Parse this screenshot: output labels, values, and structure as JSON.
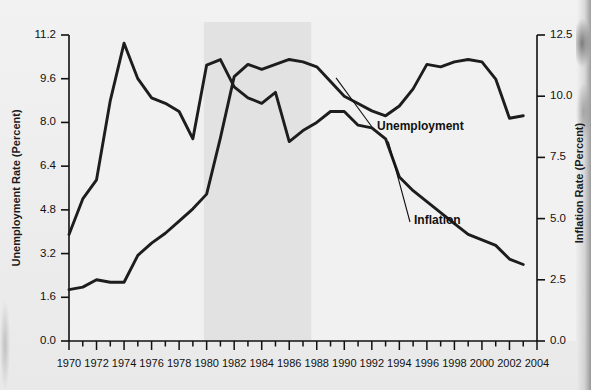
{
  "figure": {
    "background_color": "#efefef",
    "plot_background_color": "#f1f1f1",
    "shaded_band_color": "#e2e2e2",
    "line_color": "#1a1a1a",
    "axis_color": "#111111"
  },
  "labels": {
    "unemployment": "Unemployment",
    "inflation": "Inflation",
    "left_axis_title": "Unemployment Rate (Percent)",
    "right_axis_title": "Inflation Rate (Percent)"
  },
  "chart_data": {
    "type": "line",
    "title": "",
    "xlabel": "",
    "ylabel": "Unemployment Rate (Percent)",
    "y2label": "Inflation Rate (Percent)",
    "xlim": [
      1970,
      2004
    ],
    "ylim": [
      0.0,
      11.2
    ],
    "y2lim": [
      0.0,
      12.5
    ],
    "grid": false,
    "legend": "inline-annotations",
    "xticks": [
      1970,
      1971,
      1972,
      1973,
      1974,
      1975,
      1976,
      1977,
      1978,
      1979,
      1980,
      1981,
      1982,
      1983,
      1984,
      1985,
      1986,
      1987,
      1988,
      1989,
      1990,
      1991,
      1992,
      1993,
      1994,
      1995,
      1996,
      1997,
      1998,
      1999,
      2000,
      2001,
      2002,
      2003,
      2004
    ],
    "xtick_labels": [
      "1970",
      "1972",
      "1974",
      "1976",
      "1978",
      "1980",
      "1982",
      "1984",
      "1986",
      "1988",
      "1990",
      "1992",
      "1994",
      "1996",
      "1998",
      "2000",
      "2002",
      "2004"
    ],
    "xtick_label_years": [
      1970,
      1972,
      1974,
      1976,
      1978,
      1980,
      1982,
      1984,
      1986,
      1988,
      1990,
      1992,
      1994,
      1996,
      1998,
      2000,
      2002,
      2004
    ],
    "yticks": [
      0.0,
      1.6,
      3.2,
      4.8,
      6.4,
      8.0,
      9.6,
      11.2
    ],
    "ytick_labels": [
      "0.0",
      "1.6",
      "3.2",
      "4.8",
      "6.4",
      "8.0",
      "9.6",
      "11.2"
    ],
    "y2ticks": [
      0.0,
      2.5,
      5.0,
      7.5,
      10.0,
      12.5
    ],
    "y2tick_labels": [
      "0.0",
      "2.5",
      "5.0",
      "7.5",
      "10.0",
      "12.5"
    ],
    "shaded_regions": [
      {
        "name": "highlight-band",
        "x_start": 1979.8,
        "x_end": 1987.6
      }
    ],
    "x": [
      1970,
      1971,
      1972,
      1973,
      1974,
      1975,
      1976,
      1977,
      1978,
      1979,
      1980,
      1981,
      1982,
      1983,
      1984,
      1985,
      1986,
      1987,
      1988,
      1989,
      1990,
      1991,
      1992,
      1993,
      1994,
      1995,
      1996,
      1997,
      1998,
      1999,
      2000,
      2001,
      2002,
      2003
    ],
    "series": [
      {
        "name": "Unemployment",
        "axis": "right",
        "units": "percent",
        "values": [
          2.1,
          2.2,
          2.5,
          2.4,
          2.4,
          3.5,
          4.0,
          4.4,
          4.9,
          5.4,
          6.0,
          8.3,
          10.8,
          11.3,
          11.1,
          11.3,
          11.5,
          11.4,
          11.2,
          10.6,
          10.0,
          9.7,
          9.4,
          9.2,
          9.6,
          10.3,
          11.3,
          11.2,
          11.4,
          11.5,
          11.4,
          10.7,
          9.1,
          9.2
        ]
      },
      {
        "name": "Inflation",
        "axis": "left",
        "units": "percent",
        "values": [
          3.9,
          5.2,
          5.9,
          8.8,
          10.9,
          9.6,
          8.9,
          8.7,
          8.4,
          7.4,
          10.1,
          10.3,
          9.3,
          8.9,
          8.7,
          9.1,
          7.3,
          7.7,
          8.0,
          8.4,
          8.4,
          7.9,
          7.8,
          7.4,
          6.0,
          5.5,
          5.1,
          4.7,
          4.3,
          3.9,
          3.7,
          3.5,
          3.0,
          2.8
        ]
      }
    ],
    "note": "Two curves: the left-axis series peaks near 11.0 in 1974 and again near 10.2 in 1980; the right-axis series rises from about 2.0 in 1970 to about 12 in the mid-1980s and mid-1990s."
  }
}
